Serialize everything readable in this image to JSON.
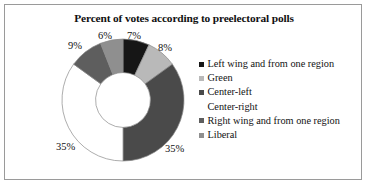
{
  "frame": {
    "border_color": "#9a9a9a",
    "background": "#ffffff"
  },
  "chart_data": {
    "type": "pie",
    "variant": "donut",
    "title": "Percent of votes according to preelectoral polls",
    "xlabel": "",
    "ylabel": "",
    "legend_position": "right",
    "grid": false,
    "start_angle_deg": 0,
    "direction": "clockwise",
    "hole_ratio": 0.45,
    "categories": [
      "Left wing and from one region",
      "Green",
      "Center-left",
      "Center-right",
      "Right wing and from one region",
      "Liberal"
    ],
    "values": [
      7,
      8,
      35,
      35,
      9,
      6
    ],
    "data_labels": [
      "7%",
      "8%",
      "35%",
      "35%",
      "9%",
      "6%"
    ],
    "colors": [
      "#161616",
      "#b9b9b9",
      "#4a4a4a",
      "#ffffff",
      "#5e5e5e",
      "#8f8f8f"
    ],
    "slice_outline_color": "#8a8a8a"
  },
  "labels": {
    "pct_9": "9%",
    "pct_6": "6%",
    "pct_7": "7%",
    "pct_8": "8%",
    "pct_35_left": "35%",
    "pct_35_right": "35%"
  },
  "legend": {
    "items": [
      {
        "label": "Left wing and from one region",
        "color": "#161616"
      },
      {
        "label": "Green",
        "color": "#b9b9b9"
      },
      {
        "label": "Center-left",
        "color": "#4a4a4a"
      },
      {
        "label": "Center-right",
        "color": "#ffffff"
      },
      {
        "label": "Right wing and from one region",
        "color": "#5e5e5e"
      },
      {
        "label": "Liberal",
        "color": "#8f8f8f"
      }
    ]
  }
}
